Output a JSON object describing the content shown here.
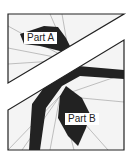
{
  "figure": {
    "colors": {
      "background": "#ffffff",
      "piece_fill": "#f4f4f4",
      "outline": "#222222",
      "dark_region": "#222222",
      "thin_line": "#999999"
    },
    "parts": [
      {
        "id": "A",
        "label": "Part A",
        "position": "upper-left triangle"
      },
      {
        "id": "B",
        "label": "Part B",
        "position": "lower-right pentagon"
      }
    ]
  }
}
